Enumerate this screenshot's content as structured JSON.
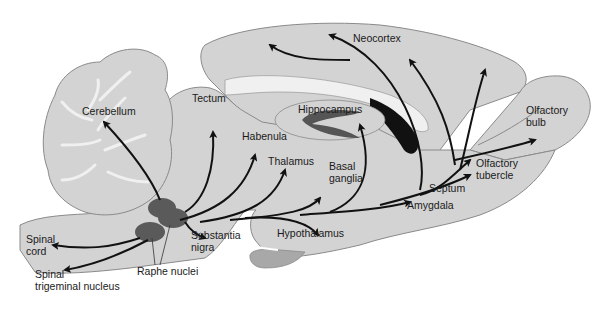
{
  "diagram": {
    "type": "sagittal brain section - serotonergic projections",
    "colors": {
      "tissue_fill": "#d3d3d3",
      "tissue_stroke": "#8a8a8a",
      "white_matter": "#f0f0f0",
      "raphe_nuclei": "#5a5a5a",
      "ventricle_dark": "#111111",
      "hippocampus_band": "#555555",
      "pituitary": "#a8a8a8",
      "arrow": "#111111",
      "background": "#ffffff"
    },
    "labels": {
      "neocortex": "Neocortex",
      "cerebellum": "Cerebellum",
      "tectum": "Tectum",
      "hippocampus": "Hippocampus",
      "olfactory_bulb": "Olfactory\nbulb",
      "habenula": "Habenula",
      "thalamus": "Thalamus",
      "basal_ganglia": "Basal\nganglia",
      "olfactory_tubercle": "Olfactory\ntubercle",
      "septum": "Septum",
      "amygdala": "Amygdala",
      "hypothalamus": "Hypothalamus",
      "substantia_nigra": "Substantia\nnigra",
      "spinal_cord": "Spinal\ncord",
      "raphe_nuclei": "Raphe nuclei",
      "spinal_trigeminal_nucleus": "Spinal\ntrigeminal nucleus"
    }
  }
}
